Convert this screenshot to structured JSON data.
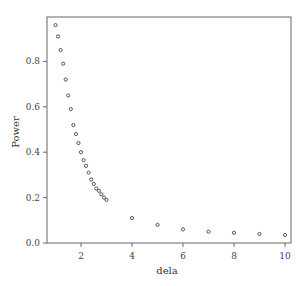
{
  "chart_data": {
    "type": "scatter",
    "title": "",
    "xlabel": "dela",
    "ylabel": "Power",
    "xlim": [
      0.7,
      10.3
    ],
    "ylim": [
      0.0,
      0.99
    ],
    "xticks": [
      2,
      4,
      6,
      8,
      10
    ],
    "yticks": [
      0.0,
      0.2,
      0.4,
      0.6,
      0.8
    ],
    "ytick_labels": [
      "0.0",
      "0.2",
      "0.4",
      "0.6",
      "0.8"
    ],
    "xtick_labels": [
      "2",
      "4",
      "6",
      "8",
      "10"
    ],
    "grid": false,
    "legend": null,
    "marker": "open-circle",
    "x": [
      1.0,
      1.1,
      1.2,
      1.3,
      1.4,
      1.5,
      1.6,
      1.7,
      1.8,
      1.9,
      2.0,
      2.1,
      2.2,
      2.3,
      2.4,
      2.5,
      2.6,
      2.7,
      2.8,
      2.9,
      3.0,
      4,
      5,
      6,
      7,
      8,
      9,
      10
    ],
    "y": [
      0.96,
      0.91,
      0.85,
      0.79,
      0.72,
      0.65,
      0.59,
      0.52,
      0.48,
      0.44,
      0.4,
      0.365,
      0.34,
      0.31,
      0.28,
      0.26,
      0.24,
      0.23,
      0.215,
      0.2,
      0.19,
      0.11,
      0.08,
      0.06,
      0.05,
      0.045,
      0.04,
      0.035
    ]
  }
}
